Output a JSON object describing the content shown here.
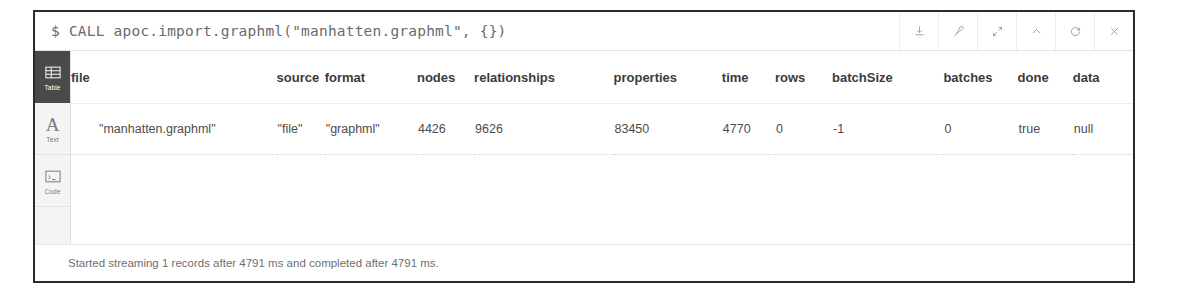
{
  "header": {
    "prompt_symbol": "$",
    "query": "CALL apoc.import.graphml(\"manhatten.graphml\", {})",
    "actions": [
      {
        "name": "download-icon",
        "label": "Download",
        "icon": "download"
      },
      {
        "name": "pin-icon",
        "label": "Pin",
        "icon": "pin"
      },
      {
        "name": "expand-icon",
        "label": "Expand",
        "icon": "expand"
      },
      {
        "name": "collapse-icon",
        "label": "Collapse",
        "icon": "chevron-up"
      },
      {
        "name": "refresh-icon",
        "label": "Refresh",
        "icon": "refresh"
      },
      {
        "name": "close-icon",
        "label": "Close",
        "icon": "close"
      }
    ]
  },
  "sidebar": {
    "active": "Table",
    "items": [
      {
        "label": "Table",
        "icon": "table-icon",
        "active": true
      },
      {
        "label": "Text",
        "icon": "text-icon",
        "active": false
      },
      {
        "label": "Code",
        "icon": "code-icon",
        "active": false
      }
    ]
  },
  "table": {
    "columns": [
      "file",
      "source",
      "format",
      "nodes",
      "relationships",
      "properties",
      "time",
      "rows",
      "batchSize",
      "batches",
      "done",
      "data"
    ],
    "rows": [
      [
        "\"manhatten.graphml\"",
        "\"file\"",
        "\"graphml\"",
        "4426",
        "9626",
        "83450",
        "4770",
        "0",
        "-1",
        "0",
        "true",
        "null"
      ]
    ]
  },
  "footer": {
    "status": "Started streaming 1 records after 4791 ms and completed after 4791 ms."
  },
  "colors": {
    "frame_border": "#2b2b2b",
    "sidebar_bg": "#f4f4f4",
    "sidebar_active_bg": "#4a4a4a",
    "header_text": "#6b6b6b",
    "table_header_text": "#3b3b3b",
    "table_cell_text": "#4d4d4d",
    "status_text": "#6f6f6f"
  }
}
